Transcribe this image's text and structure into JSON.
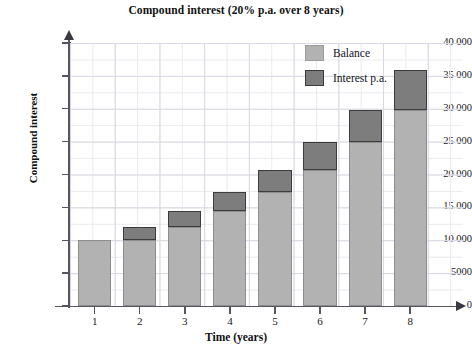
{
  "chart_data": {
    "type": "bar",
    "stacked": true,
    "title": "Compound interest (20% p.a. over 8 years)",
    "xlabel": "Time (years)",
    "ylabel": "Compound interest",
    "categories": [
      "1",
      "2",
      "3",
      "4",
      "5",
      "6",
      "7",
      "8"
    ],
    "ylim": [
      0,
      40000
    ],
    "ytick_values": [
      0,
      5000,
      10000,
      15000,
      20000,
      25000,
      30000,
      35000,
      40000
    ],
    "ytick_labels": [
      "0",
      "5000",
      "10 000",
      "15 000",
      "20 000",
      "25 000",
      "30 000",
      "35 000",
      "40 000"
    ],
    "grid": true,
    "grid_major_step": 5000,
    "grid_minor_step": 2500,
    "legend_position": "upper right",
    "series": [
      {
        "name": "Balance",
        "color": "#b2b2b2",
        "edge_color": "#8d8d8d",
        "values": [
          10000,
          10000,
          12000,
          14400,
          17280,
          20736,
          24883,
          29860
        ]
      },
      {
        "name": "Interest p.a.",
        "color": "#7d7d7d",
        "edge_color": "#3b3b3b",
        "values": [
          0,
          2000,
          2400,
          2880,
          3456,
          4147,
          4977,
          5972
        ]
      }
    ],
    "totals": [
      10000,
      12000,
      14400,
      17280,
      20736,
      24883,
      29860,
      35832
    ]
  },
  "colors": {
    "balance": "#b2b2b2",
    "balance_edge": "#8d8d8d",
    "interest": "#7d7d7d",
    "interest_edge": "#3b3b3b",
    "axis": "#555560",
    "grid_major": "#d8d8e2",
    "grid_minor": "#e9e9ef",
    "background": "#ffffff"
  },
  "legend": {
    "items": [
      {
        "label": "Balance",
        "swatch": "balance"
      },
      {
        "label": "Interest p.a.",
        "swatch": "interest"
      }
    ]
  }
}
